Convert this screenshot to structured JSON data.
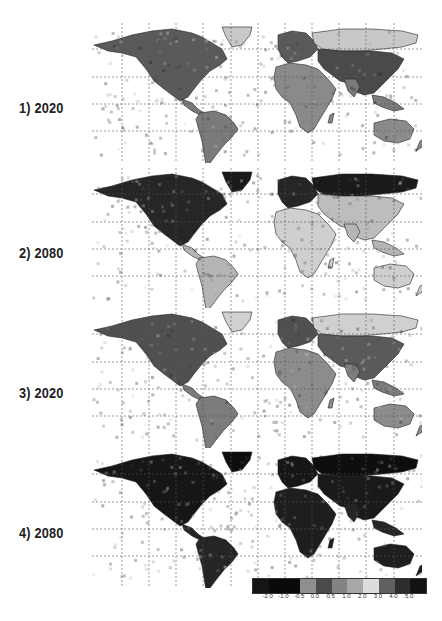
{
  "panels": [
    {
      "label": "1) 2020",
      "top": 15,
      "shade": {
        "land": "#8a8a8a",
        "north": "#5a5a5a",
        "arctic": "#c8c8c8",
        "tropics": "#7a7a7a",
        "asia": "#4a4a4a"
      }
    },
    {
      "label": "2) 2080",
      "top": 160,
      "shade": {
        "land": "#cfcfcf",
        "north": "#262626",
        "arctic": "#1a1a1a",
        "tropics": "#b5b5b5",
        "asia": "#bdbdbd"
      }
    },
    {
      "label": "3) 2020",
      "top": 300,
      "shade": {
        "land": "#8c8c8c",
        "north": "#505050",
        "arctic": "#d0d0d0",
        "tropics": "#7c7c7c",
        "asia": "#5a5a5a"
      }
    },
    {
      "label": "4) 2080",
      "top": 440,
      "shade": {
        "land": "#1e1e1e",
        "north": "#161616",
        "arctic": "#0e0e0e",
        "tropics": "#252525",
        "asia": "#1a1a1a"
      }
    }
  ],
  "colorbar": {
    "colors": [
      "#151515",
      "#0a0a0a",
      "#0a0a0a",
      "#8e8e8e",
      "#4a4a4a",
      "#838383",
      "#a8a8a8",
      "#dcdcdc",
      "#606060",
      "#2e2e2e",
      "#121212"
    ],
    "ticks": [
      "-2.0",
      "-1.0",
      "-0.5",
      "0.0",
      "0.5",
      "1.0",
      "2.0",
      "3.0",
      "4.0",
      "5.0"
    ]
  },
  "chart_data": {
    "type": "heatmap",
    "title": "",
    "panels": [
      "1) 2020",
      "2) 2080",
      "3) 2020",
      "4) 2080"
    ],
    "colorbar_ticks": [
      -2.0,
      -1.0,
      -0.5,
      0.0,
      0.5,
      1.0,
      2.0,
      3.0,
      4.0,
      5.0
    ],
    "legend_position": "bottom-right",
    "grid": true
  }
}
